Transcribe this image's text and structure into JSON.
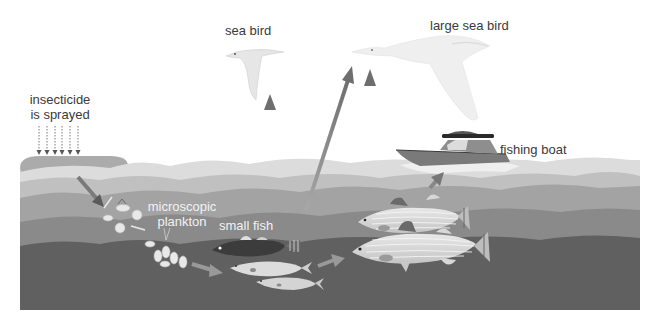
{
  "diagram": {
    "type": "food-chain-biomagnification",
    "labels": {
      "insecticide_line1": "insecticide",
      "insecticide_line2": "is sprayed",
      "sea_bird": "sea bird",
      "large_sea_bird": "large sea bird",
      "fishing_boat": "fishing boat",
      "plankton_line1": "microscopic",
      "plankton_line2": "plankton",
      "small_fish": "small fish"
    },
    "nodes": [
      {
        "id": "insecticide",
        "label": "insecticide is sprayed"
      },
      {
        "id": "plankton",
        "label": "microscopic plankton"
      },
      {
        "id": "small_fish",
        "label": "small fish"
      },
      {
        "id": "large_fish",
        "label": ""
      },
      {
        "id": "sea_bird",
        "label": "sea bird"
      },
      {
        "id": "large_sea_bird",
        "label": "large sea bird"
      },
      {
        "id": "fishing_boat",
        "label": "fishing boat"
      }
    ],
    "edges": [
      {
        "from": "insecticide",
        "to": "plankton"
      },
      {
        "from": "plankton",
        "to": "small_fish"
      },
      {
        "from": "small_fish",
        "to": "large_fish"
      },
      {
        "from": "small_fish",
        "to": "sea_bird"
      },
      {
        "from": "small_fish",
        "to": "large_sea_bird"
      },
      {
        "from": "large_fish",
        "to": "large_sea_bird"
      },
      {
        "from": "large_fish",
        "to": "fishing_boat"
      }
    ],
    "colors": {
      "background": "#ffffff",
      "spray_cloud": "#9a9a9a",
      "water_surface": "#d8d8d8",
      "water_layer1": "#bdbdbd",
      "water_layer2": "#a0a0a0",
      "water_layer3": "#858585",
      "water_deep": "#5e5e5e",
      "arrow": "#7a7a7a",
      "text": "#3a3a3a",
      "text_light": "#f2f2f2"
    }
  }
}
